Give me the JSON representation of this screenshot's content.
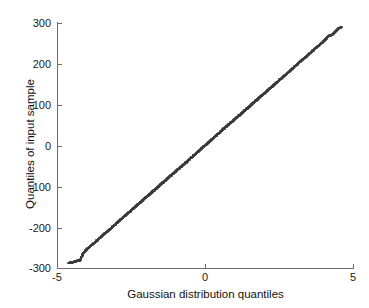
{
  "chart_data": {
    "type": "scatter",
    "title": "",
    "subtitle": "",
    "xlabel": "Gaussian distribution quantiles",
    "ylabel": "Quantiles of input sample",
    "xlim": [
      -5,
      5
    ],
    "ylim": [
      -300,
      300
    ],
    "xticks": [
      -5,
      0,
      5
    ],
    "xticklabels": [
      "-5",
      "0",
      "5"
    ],
    "yticks": [
      300,
      200,
      100,
      0,
      -100,
      -200,
      -300
    ],
    "yticklabels": [
      "300",
      "200",
      "100",
      "0",
      "-100",
      "-200",
      "-300"
    ],
    "grid": false,
    "legend": null,
    "legend_position": "none",
    "box": "off",
    "tick_direction": "in",
    "marker": "+",
    "marker_color": "#3a3a3a",
    "background": "#ffffff",
    "axis_color": "#6e6e6e",
    "annotations": [],
    "series": [
      {
        "name": "input sample quantiles",
        "x": [
          -4.62,
          -4.48,
          -4.36,
          -4.3,
          -4.22,
          -4.12,
          -4.05,
          -3.98,
          -3.9,
          -3.83,
          -3.76,
          -3.7,
          -3.64,
          -3.58,
          -3.52,
          -3.46,
          -3.41,
          -3.36,
          -3.31,
          -3.26,
          -3.21,
          -3.16,
          -3.12,
          -3.07,
          -3.03,
          -2.99,
          -2.95,
          -2.91,
          -2.87,
          -2.83,
          -2.79,
          -2.75,
          -2.72,
          -2.68,
          -2.65,
          -2.61,
          -2.58,
          -2.54,
          -2.51,
          -2.48,
          -2.45,
          -2.41,
          -2.38,
          -2.35,
          -2.32,
          -2.29,
          -2.26,
          -2.23,
          -2.2,
          -2.17,
          -2.15,
          -2.12,
          -2.09,
          -2.06,
          -2.04,
          -2.01,
          -1.98,
          -1.96,
          -1.93,
          -1.9,
          -1.88,
          -1.85,
          -1.83,
          -1.8,
          -1.78,
          -1.75,
          -1.73,
          -1.7,
          -1.68,
          -1.66,
          -1.63,
          -1.61,
          -1.59,
          -1.56,
          -1.54,
          -1.52,
          -1.5,
          -1.47,
          -1.45,
          -1.43,
          -1.41,
          -1.39,
          -1.37,
          -1.34,
          -1.32,
          -1.3,
          -1.28,
          -1.26,
          -1.24,
          -1.22,
          -1.2,
          -1.18,
          -1.16,
          -1.14,
          -1.12,
          -1.1,
          -1.08,
          -1.06,
          -1.04,
          -1.02,
          -1.0,
          -0.98,
          -0.96,
          -0.94,
          -0.92,
          -0.9,
          -0.88,
          -0.86,
          -0.84,
          -0.82,
          -0.8,
          -0.79,
          -0.77,
          -0.75,
          -0.73,
          -0.71,
          -0.69,
          -0.67,
          -0.65,
          -0.63,
          -0.62,
          -0.6,
          -0.58,
          -0.56,
          -0.54,
          -0.52,
          -0.5,
          -0.49,
          -0.47,
          -0.45,
          -0.43,
          -0.41,
          -0.39,
          -0.38,
          -0.36,
          -0.34,
          -0.32,
          -0.3,
          -0.28,
          -0.27,
          -0.25,
          -0.23,
          -0.21,
          -0.19,
          -0.18,
          -0.16,
          -0.14,
          -0.12,
          -0.1,
          -0.08,
          -0.07,
          -0.05,
          -0.03,
          -0.01,
          0.01,
          0.03,
          0.05,
          0.07,
          0.08,
          0.1,
          0.12,
          0.14,
          0.16,
          0.18,
          0.19,
          0.21,
          0.23,
          0.25,
          0.27,
          0.28,
          0.3,
          0.32,
          0.34,
          0.36,
          0.38,
          0.39,
          0.41,
          0.43,
          0.45,
          0.47,
          0.49,
          0.5,
          0.52,
          0.54,
          0.56,
          0.58,
          0.6,
          0.62,
          0.63,
          0.65,
          0.67,
          0.69,
          0.71,
          0.73,
          0.75,
          0.77,
          0.79,
          0.8,
          0.82,
          0.84,
          0.86,
          0.88,
          0.9,
          0.92,
          0.94,
          0.96,
          0.98,
          1.0,
          1.02,
          1.04,
          1.06,
          1.08,
          1.1,
          1.12,
          1.14,
          1.16,
          1.18,
          1.2,
          1.22,
          1.24,
          1.26,
          1.28,
          1.3,
          1.32,
          1.34,
          1.37,
          1.39,
          1.41,
          1.43,
          1.45,
          1.47,
          1.5,
          1.52,
          1.54,
          1.56,
          1.59,
          1.61,
          1.63,
          1.66,
          1.68,
          1.7,
          1.73,
          1.75,
          1.78,
          1.8,
          1.83,
          1.85,
          1.88,
          1.9,
          1.93,
          1.96,
          1.98,
          2.01,
          2.04,
          2.06,
          2.09,
          2.12,
          2.15,
          2.17,
          2.2,
          2.23,
          2.26,
          2.29,
          2.32,
          2.35,
          2.38,
          2.41,
          2.45,
          2.48,
          2.51,
          2.54,
          2.58,
          2.61,
          2.65,
          2.68,
          2.72,
          2.75,
          2.79,
          2.83,
          2.87,
          2.91,
          2.95,
          2.99,
          3.03,
          3.07,
          3.12,
          3.16,
          3.21,
          3.26,
          3.31,
          3.36,
          3.41,
          3.46,
          3.52,
          3.58,
          3.64,
          3.7,
          3.76,
          3.83,
          3.9,
          3.98,
          4.05,
          4.12,
          4.18,
          4.22,
          4.26,
          4.3,
          4.34,
          4.38,
          4.44,
          4.5,
          4.56,
          4.62
        ],
        "y": [
          -288,
          -286,
          -284,
          -282,
          -281,
          -265,
          -259,
          -254,
          -249,
          -244,
          -240,
          -236,
          -232,
          -228,
          -224,
          -221,
          -217,
          -214,
          -211,
          -208,
          -205,
          -202,
          -199,
          -196,
          -193,
          -190,
          -188,
          -185,
          -183,
          -180,
          -178,
          -175,
          -173,
          -171,
          -169,
          -166,
          -164,
          -162,
          -160,
          -158,
          -156,
          -154,
          -152,
          -150,
          -148,
          -146,
          -144,
          -142,
          -140,
          -138,
          -137,
          -135,
          -133,
          -131,
          -130,
          -128,
          -126,
          -125,
          -123,
          -121,
          -120,
          -118,
          -117,
          -115,
          -113,
          -112,
          -110,
          -109,
          -107,
          -106,
          -104,
          -103,
          -101,
          -100,
          -98,
          -97,
          -95,
          -94,
          -92,
          -91,
          -90,
          -88,
          -87,
          -86,
          -84,
          -83,
          -82,
          -80,
          -79,
          -78,
          -76,
          -75,
          -74,
          -73,
          -71,
          -70,
          -69,
          -68,
          -66,
          -65,
          -64,
          -63,
          -61,
          -60,
          -59,
          -58,
          -57,
          -55,
          -54,
          -53,
          -52,
          -51,
          -49,
          -48,
          -47,
          -46,
          -45,
          -43,
          -42,
          -41,
          -40,
          -39,
          -37,
          -36,
          -35,
          -34,
          -33,
          -31,
          -30,
          -29,
          -28,
          -27,
          -25,
          -24,
          -23,
          -22,
          -21,
          -19,
          -18,
          -17,
          -16,
          -15,
          -14,
          -12,
          -11,
          -10,
          -9,
          -8,
          -6,
          -5,
          -4,
          -3,
          -2,
          -1,
          1,
          2,
          3,
          4,
          5,
          6,
          8,
          9,
          10,
          11,
          12,
          14,
          15,
          16,
          17,
          18,
          19,
          21,
          22,
          23,
          24,
          25,
          27,
          28,
          29,
          30,
          31,
          33,
          34,
          35,
          36,
          37,
          39,
          40,
          41,
          42,
          43,
          45,
          46,
          47,
          48,
          49,
          51,
          52,
          53,
          54,
          55,
          57,
          58,
          59,
          60,
          61,
          63,
          64,
          65,
          66,
          68,
          69,
          70,
          71,
          73,
          74,
          75,
          76,
          78,
          79,
          80,
          82,
          83,
          84,
          86,
          87,
          88,
          90,
          91,
          92,
          94,
          95,
          97,
          98,
          100,
          101,
          103,
          104,
          106,
          107,
          109,
          110,
          112,
          113,
          115,
          117,
          118,
          120,
          121,
          123,
          125,
          126,
          128,
          130,
          131,
          133,
          135,
          137,
          138,
          140,
          142,
          144,
          146,
          148,
          150,
          152,
          154,
          156,
          158,
          160,
          162,
          164,
          166,
          169,
          171,
          173,
          175,
          178,
          180,
          183,
          185,
          188,
          190,
          193,
          196,
          199,
          202,
          205,
          208,
          211,
          214,
          217,
          221,
          224,
          228,
          232,
          236,
          240,
          244,
          249,
          254,
          259,
          264,
          268,
          271,
          269,
          272,
          275,
          277,
          282,
          286,
          288,
          290
        ]
      }
    ]
  },
  "axes": {
    "y_ticklabels": [
      "300",
      "200",
      "100",
      "0",
      "-100",
      "-200",
      "-300"
    ],
    "x_ticklabels": [
      "-5",
      "0",
      "5"
    ],
    "xlabel": "Gaussian distribution quantiles",
    "ylabel": "Quantiles of input sample"
  }
}
